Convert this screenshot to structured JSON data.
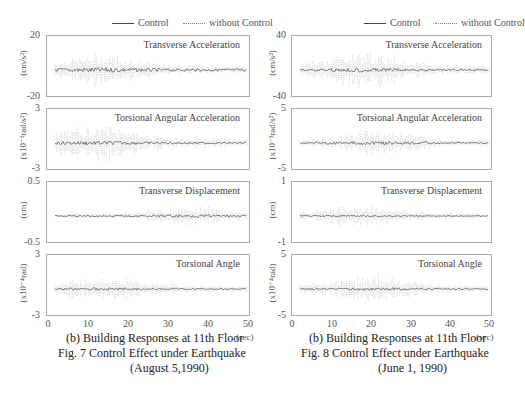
{
  "chart_data": [
    {
      "type": "line",
      "figure_caption": "Fig. 7  Control Effect under Earthquake",
      "figure_date": "(August 5,1990)",
      "subcaption": "(b) Building Responses at 11th Floor",
      "legend": [
        "Control",
        "without Control"
      ],
      "legend_position": "top-right",
      "xlabel": "(sec)",
      "xlim": [
        0,
        50
      ],
      "xticks": [
        "0",
        "10",
        "20",
        "30",
        "40",
        "50"
      ],
      "grid": false,
      "panels": [
        {
          "title": "Transverse Acceleration",
          "ylabel": "(cm/s²)",
          "ylim": [
            -20,
            20
          ],
          "yticks": [
            "20",
            "-20"
          ],
          "series": [
            {
              "name": "Control",
              "peak_amplitude": 3,
              "envelope_peak_t": 15
            },
            {
              "name": "without Control",
              "peak_amplitude": 12,
              "envelope_peak_t": 13
            }
          ]
        },
        {
          "title": "Torsional Angular Acceleration",
          "ylabel": "(x10⁻²rad/s²)",
          "ylim": [
            -3,
            3
          ],
          "yticks": [
            "3",
            "-3"
          ],
          "series": [
            {
              "name": "Control",
              "peak_amplitude": 0.4,
              "envelope_peak_t": 14
            },
            {
              "name": "without Control",
              "peak_amplitude": 2.2,
              "envelope_peak_t": 12
            }
          ]
        },
        {
          "title": "Transverse Displacement",
          "ylabel": "(cm)",
          "ylim": [
            -0.5,
            0.5
          ],
          "yticks": [
            "0.5",
            "-0.5"
          ],
          "series": [
            {
              "name": "Control",
              "peak_amplitude": 0.05,
              "envelope_peak_t": 14
            },
            {
              "name": "without Control",
              "peak_amplitude": 0.2,
              "envelope_peak_t": 35
            }
          ]
        },
        {
          "title": "Torsional Angle",
          "ylabel": "(x10⁻⁴rad)",
          "ylim": [
            -3,
            3
          ],
          "yticks": [
            "3",
            "-3"
          ],
          "series": [
            {
              "name": "Control",
              "peak_amplitude": 0.2,
              "envelope_peak_t": 15
            },
            {
              "name": "without Control",
              "peak_amplitude": 1.6,
              "envelope_peak_t": 14
            }
          ]
        }
      ]
    },
    {
      "type": "line",
      "figure_caption": "Fig. 8  Control Effect under Earthquake",
      "figure_date": "(June 1, 1990)",
      "subcaption": "(b) Building Responses at 11th Floor",
      "legend": [
        "Control",
        "without Control"
      ],
      "legend_position": "top-right",
      "xlabel": "(sec)",
      "xlim": [
        0,
        50
      ],
      "xticks": [
        "0",
        "10",
        "20",
        "30",
        "40",
        "50"
      ],
      "grid": false,
      "panels": [
        {
          "title": "Transverse Acceleration",
          "ylabel": "(cm/s²)",
          "ylim": [
            -40,
            40
          ],
          "yticks": [
            "40",
            "-40"
          ],
          "series": [
            {
              "name": "Control",
              "peak_amplitude": 5,
              "envelope_peak_t": 20
            },
            {
              "name": "without Control",
              "peak_amplitude": 30,
              "envelope_peak_t": 18
            }
          ]
        },
        {
          "title": "Torsional Angular Acceleration",
          "ylabel": "(x10⁻³rad/s²)",
          "ylim": [
            -5,
            5
          ],
          "yticks": [
            "5",
            "-5"
          ],
          "series": [
            {
              "name": "Control",
              "peak_amplitude": 0.6,
              "envelope_peak_t": 20
            },
            {
              "name": "without Control",
              "peak_amplitude": 2.8,
              "envelope_peak_t": 22
            }
          ]
        },
        {
          "title": "Transverse Displacement",
          "ylabel": "(cm)",
          "ylim": [
            -1,
            1
          ],
          "yticks": [
            "1",
            "-1"
          ],
          "series": [
            {
              "name": "Control",
              "peak_amplitude": 0.05,
              "envelope_peak_t": 20
            },
            {
              "name": "without Control",
              "peak_amplitude": 0.45,
              "envelope_peak_t": 17
            }
          ]
        },
        {
          "title": "Torsional Angle",
          "ylabel": "(x10⁻⁴rad)",
          "ylim": [
            -5,
            5
          ],
          "yticks": [
            "5",
            "-5"
          ],
          "series": [
            {
              "name": "Control",
              "peak_amplitude": 0.3,
              "envelope_peak_t": 20
            },
            {
              "name": "without Control",
              "peak_amplitude": 3,
              "envelope_peak_t": 20
            }
          ]
        }
      ]
    }
  ],
  "figures": [
    {
      "legend": {
        "control": "Control",
        "without": "without Control"
      },
      "panels": [
        {
          "title": "Transverse Acceleration",
          "ylabel": "(cm/s²)",
          "ytop": "20",
          "ybot": "-20"
        },
        {
          "title": "Torsional Angular Acceleration",
          "ylabel": "(x10⁻²rad/s²)",
          "ytop": "3",
          "ybot": "-3"
        },
        {
          "title": "Transverse Displacement",
          "ylabel": "(cm)",
          "ytop": "0.5",
          "ybot": "-0.5"
        },
        {
          "title": "Torsional Angle",
          "ylabel": "(x10⁻⁴rad)",
          "ytop": "3",
          "ybot": "-3"
        }
      ],
      "xticks": [
        "0",
        "10",
        "20",
        "30",
        "40",
        "50"
      ],
      "xunit": "(sec)",
      "subcaption": "(b) Building Responses at 11th Floor",
      "caption": "Fig. 7  Control Effect under Earthquake",
      "date": "(August 5,1990)"
    },
    {
      "legend": {
        "control": "Control",
        "without": "without Control"
      },
      "panels": [
        {
          "title": "Transverse Acceleration",
          "ylabel": "(cm/s²)",
          "ytop": "40",
          "ybot": "-40"
        },
        {
          "title": "Torsional Angular Acceleration",
          "ylabel": "(x10⁻³rad/s²)",
          "ytop": "5",
          "ybot": "-5"
        },
        {
          "title": "Transverse Displacement",
          "ylabel": "(cm)",
          "ytop": "1",
          "ybot": "-1"
        },
        {
          "title": "Torsional Angle",
          "ylabel": "(x10⁻⁴rad)",
          "ytop": "5",
          "ybot": "-5"
        }
      ],
      "xticks": [
        "0",
        "10",
        "20",
        "30",
        "40",
        "50"
      ],
      "xunit": "(sec)",
      "subcaption": "(b) Building Responses at 11th Floor",
      "caption": "Fig. 8  Control Effect under Earthquake",
      "date": "(June 1, 1990)"
    }
  ]
}
